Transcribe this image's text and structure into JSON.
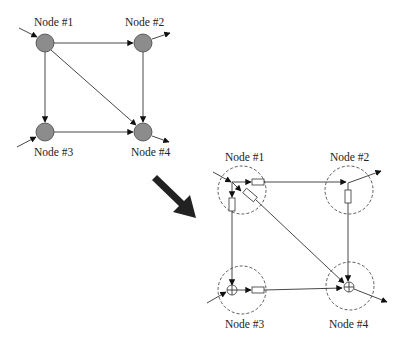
{
  "diagram": {
    "top_graph": {
      "nodes": [
        {
          "id": "n1",
          "label": "Node #1"
        },
        {
          "id": "n2",
          "label": "Node #2"
        },
        {
          "id": "n3",
          "label": "Node #3"
        },
        {
          "id": "n4",
          "label": "Node #4"
        }
      ],
      "edges": [
        {
          "from": "n1",
          "to": "n2"
        },
        {
          "from": "n1",
          "to": "n3"
        },
        {
          "from": "n1",
          "to": "n4"
        },
        {
          "from": "n2",
          "to": "n4"
        },
        {
          "from": "n3",
          "to": "n4"
        }
      ],
      "external_inputs": [
        "n1",
        "n3"
      ],
      "external_outputs": [
        "n2",
        "n4"
      ]
    },
    "transform_arrow": "big-arrow-down-right",
    "bottom_graph": {
      "nodes": [
        {
          "id": "n1",
          "label": "Node #1",
          "type": "split-with-blocks"
        },
        {
          "id": "n2",
          "label": "Node #2",
          "type": "split-with-block"
        },
        {
          "id": "n3",
          "label": "Node #3",
          "type": "summing-junction"
        },
        {
          "id": "n4",
          "label": "Node #4",
          "type": "summing-junction"
        }
      ]
    }
  }
}
